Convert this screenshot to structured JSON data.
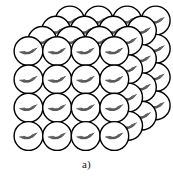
{
  "figure": {
    "caption": "a)",
    "background_color": "#ffffff",
    "stroke_color": "#000000",
    "sphere_fill_color": "#ffffff",
    "hatch_color": "#555555"
  },
  "lattice": {
    "type": "sphere-packing-cube",
    "columns": 4,
    "rows": 4,
    "depth_layers": 4,
    "sphere_radius": 14.4,
    "column_step_x": 28.6,
    "row_step_y": 28.3,
    "depth_step_x": 13.8,
    "depth_step_y": -10.2,
    "front_origin_x": 28.5,
    "front_origin_y": 136.0,
    "hatch_arc_count": 6,
    "shading_quadrant": "lower-right"
  },
  "chart_data": {
    "type": "scatter",
    "xlabel": "",
    "ylabel": "",
    "grid": false,
    "legend": null,
    "annotations": [
      "a)"
    ],
    "series": [
      {
        "name": "lattice-spheres",
        "description": "4 x 4 x 4 array of equal spheres drawn in oblique projection"
      }
    ]
  }
}
